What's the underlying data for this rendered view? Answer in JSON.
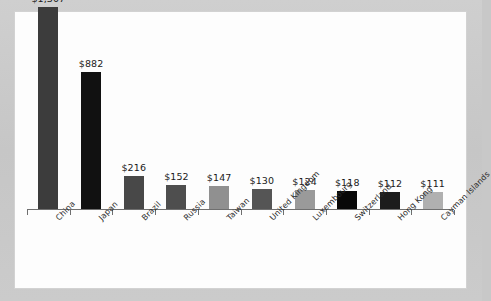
{
  "chart_data": {
    "type": "bar",
    "title": "",
    "subtitle": "",
    "xlabel": "",
    "ylabel": "",
    "grid": false,
    "legend": "none",
    "ylim": [
      0,
      1400
    ],
    "value_prefix": "$",
    "categories": [
      "China",
      "Japan",
      "Brazil",
      "Russia",
      "Taiwan",
      "United Kingdom",
      "Luxembourg",
      "Switzerland",
      "Hong Kong",
      "Cayman Islands"
    ],
    "values": [
      1307,
      882,
      216,
      152,
      147,
      130,
      124,
      118,
      112,
      111
    ],
    "value_labels": [
      "$1,307",
      "$882",
      "$216",
      "$152",
      "$147",
      "$130",
      "$124",
      "$118",
      "$112",
      "$111"
    ],
    "bar_colors": [
      "#3c3c3c",
      "#111111",
      "#484848",
      "#4e4e4e",
      "#909090",
      "#555555",
      "#9a9a9a",
      "#080808",
      "#1c1c1c",
      "#b0b0b0"
    ]
  },
  "figure": {
    "background_color": "#c8c8c8",
    "panel_color": "#fdfdfd",
    "axis_color": "#6f6f6f",
    "text_color": "#1a1a1a"
  }
}
